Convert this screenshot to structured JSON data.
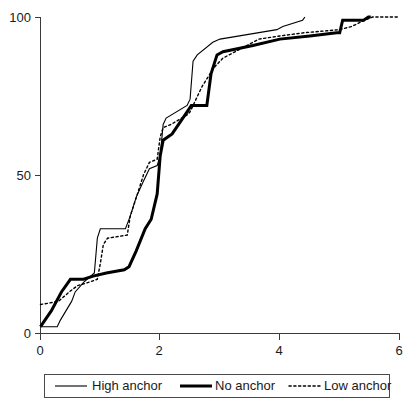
{
  "chart_data": {
    "type": "line",
    "title": "",
    "subtitle": "",
    "xlabel": "",
    "ylabel": "",
    "xlim": [
      0,
      6
    ],
    "ylim": [
      0,
      100
    ],
    "xticks": [
      0,
      2,
      4,
      6
    ],
    "xtick_labels": [
      "0",
      "2",
      "4",
      "6"
    ],
    "yticks": [
      0,
      50,
      100
    ],
    "ytick_labels": [
      "0",
      "50",
      "100"
    ],
    "grid": false,
    "legend_position": "below-center",
    "series": [
      {
        "name": "High anchor",
        "style": "thin-solid",
        "color": "#000000",
        "points": [
          [
            0.0,
            2
          ],
          [
            0.28,
            2
          ],
          [
            0.33,
            4
          ],
          [
            0.52,
            10
          ],
          [
            0.58,
            13
          ],
          [
            0.72,
            16
          ],
          [
            0.9,
            19
          ],
          [
            0.95,
            30
          ],
          [
            1.0,
            33
          ],
          [
            1.42,
            33
          ],
          [
            1.5,
            37
          ],
          [
            1.6,
            43
          ],
          [
            1.72,
            48
          ],
          [
            1.82,
            52
          ],
          [
            1.95,
            53
          ],
          [
            2.0,
            56
          ],
          [
            2.05,
            66
          ],
          [
            2.1,
            68
          ],
          [
            2.45,
            72
          ],
          [
            2.5,
            74
          ],
          [
            2.55,
            86
          ],
          [
            2.62,
            88
          ],
          [
            2.88,
            92
          ],
          [
            3.0,
            93
          ],
          [
            3.95,
            96
          ],
          [
            4.05,
            97
          ],
          [
            4.38,
            99
          ],
          [
            4.42,
            100
          ]
        ]
      },
      {
        "name": "No anchor",
        "style": "thick-solid",
        "color": "#000000",
        "points": [
          [
            0.0,
            2
          ],
          [
            0.18,
            7
          ],
          [
            0.35,
            13
          ],
          [
            0.5,
            17
          ],
          [
            0.72,
            17
          ],
          [
            0.88,
            18
          ],
          [
            1.1,
            19
          ],
          [
            1.4,
            20
          ],
          [
            1.48,
            21
          ],
          [
            1.6,
            26
          ],
          [
            1.75,
            33
          ],
          [
            1.85,
            36
          ],
          [
            1.95,
            44
          ],
          [
            2.0,
            56
          ],
          [
            2.05,
            61
          ],
          [
            2.2,
            63
          ],
          [
            2.45,
            70
          ],
          [
            2.52,
            72
          ],
          [
            2.78,
            72
          ],
          [
            2.85,
            82
          ],
          [
            2.95,
            88
          ],
          [
            3.05,
            89
          ],
          [
            3.55,
            91
          ],
          [
            4.0,
            93
          ],
          [
            4.5,
            94
          ],
          [
            4.95,
            95
          ],
          [
            5.0,
            95
          ],
          [
            5.05,
            99
          ],
          [
            5.4,
            99
          ],
          [
            5.48,
            100
          ],
          [
            5.52,
            100
          ]
        ]
      },
      {
        "name": "Low anchor",
        "style": "dotted",
        "color": "#000000",
        "points": [
          [
            0.0,
            9
          ],
          [
            0.3,
            10
          ],
          [
            0.48,
            13
          ],
          [
            0.62,
            15
          ],
          [
            0.8,
            16
          ],
          [
            0.95,
            17
          ],
          [
            1.0,
            22
          ],
          [
            1.05,
            28
          ],
          [
            1.12,
            30
          ],
          [
            1.45,
            31
          ],
          [
            1.5,
            37
          ],
          [
            1.62,
            44
          ],
          [
            1.72,
            50
          ],
          [
            1.82,
            54
          ],
          [
            1.95,
            55
          ],
          [
            2.0,
            62
          ],
          [
            2.05,
            65
          ],
          [
            2.18,
            66
          ],
          [
            2.45,
            69
          ],
          [
            2.5,
            70
          ],
          [
            2.7,
            78
          ],
          [
            2.9,
            84
          ],
          [
            3.05,
            87
          ],
          [
            3.35,
            90
          ],
          [
            3.65,
            93
          ],
          [
            4.0,
            94
          ],
          [
            4.4,
            95
          ],
          [
            5.0,
            96
          ],
          [
            5.2,
            97
          ],
          [
            5.42,
            99
          ],
          [
            5.55,
            100
          ],
          [
            6.0,
            100
          ]
        ]
      }
    ],
    "legend": [
      {
        "label": "High anchor",
        "style": "thin-solid"
      },
      {
        "label": "No anchor",
        "style": "thick-solid"
      },
      {
        "label": "Low anchor",
        "style": "dotted"
      }
    ]
  },
  "axes": {
    "y_tick_100": "100",
    "y_tick_50": "50",
    "y_tick_0": "0",
    "x_tick_0": "0",
    "x_tick_2": "2",
    "x_tick_4": "4",
    "x_tick_6": "6"
  },
  "legend": {
    "high_label": "High anchor",
    "no_label": "No anchor",
    "low_label": "Low anchor"
  },
  "colors": {
    "line": "#000000",
    "axis": "#3a3a3a",
    "background": "#ffffff",
    "legend_border": "#4a4a4a"
  }
}
